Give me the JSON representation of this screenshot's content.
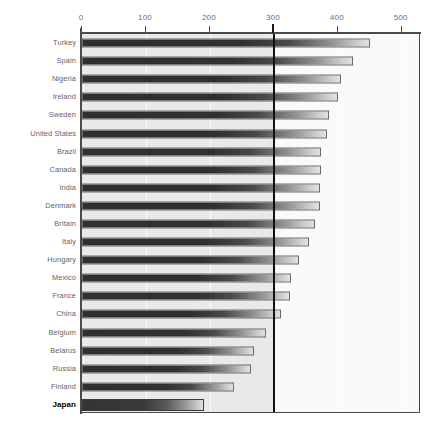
{
  "chart_data": {
    "type": "bar",
    "orientation": "horizontal",
    "title": "",
    "subtitle": "",
    "xlabel": "",
    "ylabel": "",
    "xlim": [
      0,
      530
    ],
    "xticks": [
      0,
      100,
      200,
      300,
      400,
      500
    ],
    "xtick_labels": [
      "0",
      "100",
      "200",
      "300",
      "400",
      "500"
    ],
    "grid": true,
    "grid_axis": "x",
    "legend": false,
    "reference_line": 300,
    "highlight_category": "Japan",
    "categories": [
      "Turkey",
      "Spain",
      "Nigeria",
      "Ireland",
      "Sweden",
      "United States",
      "Brazil",
      "Canada",
      "India",
      "Denmark",
      "Britain",
      "Italy",
      "Hungary",
      "Mexico",
      "France",
      "China",
      "Belgium",
      "Belarus",
      "Russia",
      "Finland",
      "Japan"
    ],
    "values": [
      450,
      424,
      405,
      400,
      386,
      383,
      373,
      373,
      372,
      372,
      364,
      355,
      339,
      327,
      325,
      311,
      288,
      269,
      264,
      238,
      191
    ],
    "series": [
      {
        "name": "value",
        "values": [
          450,
          424,
          405,
          400,
          386,
          383,
          373,
          373,
          372,
          372,
          364,
          355,
          339,
          327,
          325,
          311,
          288,
          269,
          264,
          238,
          191
        ]
      }
    ],
    "colors": {
      "bar_start": "#2f2f2f",
      "bar_end": "#e2e2e2",
      "bar_border": "#6a6a6a",
      "plot_background_left": "#e9e9e9",
      "plot_background_right": "#fafafa",
      "axis": "#4a4a4a",
      "reference_line": "#111111",
      "label": "#5f5f5f",
      "highlight_label": "#000000"
    }
  }
}
